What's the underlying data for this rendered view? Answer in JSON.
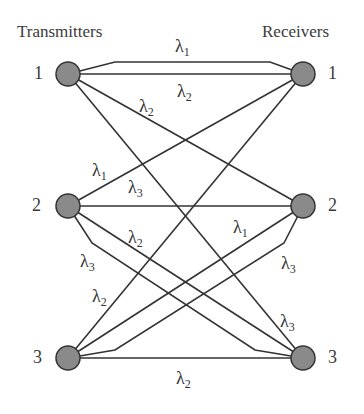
{
  "headings": {
    "left": "Transmitters",
    "right": "Receivers"
  },
  "transmitters": [
    {
      "id": "1",
      "label": "1"
    },
    {
      "id": "2",
      "label": "2"
    },
    {
      "id": "3",
      "label": "3"
    }
  ],
  "receivers": [
    {
      "id": "1",
      "label": "1"
    },
    {
      "id": "2",
      "label": "2"
    },
    {
      "id": "3",
      "label": "3"
    }
  ],
  "wavelength_symbol": "λ",
  "links": [
    {
      "from": "T1",
      "to": "R1",
      "wavelength": "1",
      "shape": "bent-upper"
    },
    {
      "from": "T1",
      "to": "R1",
      "wavelength": "2",
      "shape": "straight"
    },
    {
      "from": "T1",
      "to": "R2",
      "wavelength": "2",
      "shape": "straight"
    },
    {
      "from": "T1",
      "to": "R3",
      "wavelength": "",
      "shape": "straight"
    },
    {
      "from": "T2",
      "to": "R1",
      "wavelength": "1",
      "shape": "straight"
    },
    {
      "from": "T2",
      "to": "R2",
      "wavelength": "3",
      "shape": "straight"
    },
    {
      "from": "T2",
      "to": "R3",
      "wavelength": "2",
      "shape": "straight"
    },
    {
      "from": "T2",
      "to": "R3",
      "wavelength": "3",
      "shape": "bent"
    },
    {
      "from": "T3",
      "to": "R1",
      "wavelength": "2",
      "shape": "straight"
    },
    {
      "from": "T3",
      "to": "R2",
      "wavelength": "1",
      "shape": "straight"
    },
    {
      "from": "T3",
      "to": "R2",
      "wavelength": "3",
      "shape": "bent"
    },
    {
      "from": "T3",
      "to": "R3",
      "wavelength": "2",
      "shape": "straight"
    }
  ],
  "labels": {
    "t1r1_top": {
      "sym": "λ",
      "sub": "1"
    },
    "t1r1_straight": {
      "sym": "λ",
      "sub": "2"
    },
    "t1r2": {
      "sym": "λ",
      "sub": "2"
    },
    "t2r1": {
      "sym": "λ",
      "sub": "1"
    },
    "t2r2": {
      "sym": "λ",
      "sub": "3"
    },
    "t2r3": {
      "sym": "λ",
      "sub": "2"
    },
    "t2r3_bent": {
      "sym": "λ",
      "sub": "3"
    },
    "t3r1": {
      "sym": "λ",
      "sub": "2"
    },
    "t3r2": {
      "sym": "λ",
      "sub": "1"
    },
    "t3r2_bent": {
      "sym": "λ",
      "sub": "3"
    },
    "t1r3": {
      "sym": "λ",
      "sub": "3"
    },
    "t3r3": {
      "sym": "λ",
      "sub": "2"
    }
  },
  "colors": {
    "node_fill": "#8a8a8a",
    "stroke": "#333333"
  }
}
